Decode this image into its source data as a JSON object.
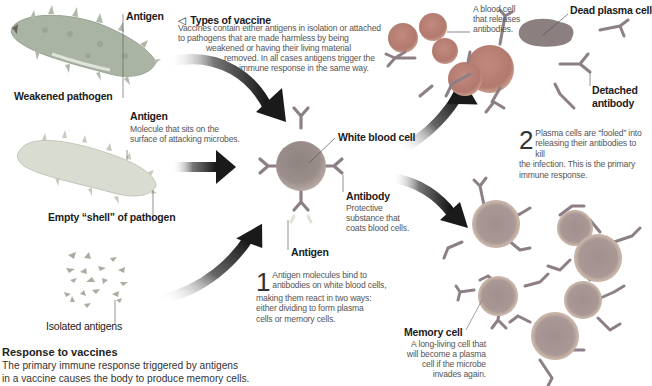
{
  "diagram": {
    "title": "Types of vaccine",
    "title_icon": "triangle-left-icon",
    "intro_lines": [
      "Vaccines contain either antigens in isolation or attached",
      "to pathogens that are made harmless by being",
      "weakened or having their living material",
      "removed.  In all cases antigens trigger the",
      "immune response in the same way."
    ],
    "labels": {
      "antigen_top": "Antigen",
      "weakened_pathogen": "Weakened pathogen",
      "antigen_mid_title": "Antigen",
      "antigen_mid_desc": [
        "Molecule that sits on the",
        "surface of attacking microbes."
      ],
      "empty_shell": "Empty “shell” of pathogen",
      "isolated_antigens": "Isolated antigens",
      "white_blood_cell": "White blood cell",
      "antibody_title": "Antibody",
      "antibody_desc": [
        "Protective",
        "substance that",
        "coats blood cells."
      ],
      "antigen_bottom": "Antigen",
      "plasma_cell_desc": [
        "A blood cell",
        "that releases",
        "antibodies."
      ],
      "dead_plasma_cell": "Dead plasma cell",
      "detached_antibody": [
        "Detached",
        "antibody"
      ],
      "memory_cell_title": "Memory cell",
      "memory_cell_desc": [
        "A long-living cell that",
        "will become a plasma",
        "cell if the microbe",
        "invades again."
      ]
    },
    "steps": [
      {
        "number": "1",
        "first_lines": [
          "Antigen molecules bind to",
          "antibodies on white blood cells,"
        ],
        "rest_lines": [
          "making them react in two ways:",
          "either dividing to form plasma",
          "cells or memory cells."
        ]
      },
      {
        "number": "2",
        "first_lines": [
          "Plasma cells are “fooled” into",
          "releasing their antibodies to kill"
        ],
        "rest_lines": [
          "the infection. This is the primary",
          "immune response."
        ]
      }
    ],
    "footer": {
      "title": "Response to vaccines",
      "lines": [
        "The primary immune response triggered by antigens",
        "in a vaccine causes the body to produce memory cells."
      ]
    },
    "colors": {
      "pathogen": "#a9b4a4",
      "shell": "#d7dccf",
      "cell": "#9a8a86",
      "cell_rim": "#b9a7a0",
      "plasma": "#b0756a",
      "antibody": "#8d7f86",
      "arrow": "#1a1a1a"
    }
  }
}
